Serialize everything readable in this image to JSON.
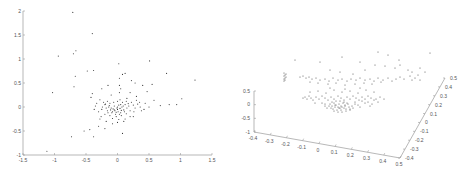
{
  "chart_data": [
    {
      "type": "scatter",
      "title": "",
      "xlabel": "",
      "ylabel": "",
      "xlim": [
        -1.5,
        1.5
      ],
      "ylim": [
        -1,
        2
      ],
      "grid": false,
      "legend": null,
      "x_ticks": [
        "-1.5",
        "-1",
        "-0.5",
        "0",
        "0.5",
        "1",
        "1.5"
      ],
      "y_ticks": [
        "2",
        "1.5",
        "1",
        "0.5",
        "0",
        "-0.5",
        "-1"
      ],
      "frame": {
        "left": 23,
        "right": 212,
        "top": 11,
        "bottom": 155
      },
      "points": [
        [
          -0.71,
          1.97
        ],
        [
          -0.4,
          1.53
        ],
        [
          -0.66,
          1.17
        ],
        [
          -0.7,
          1.11
        ],
        [
          -0.94,
          1.06
        ],
        [
          0.02,
          0.9
        ],
        [
          0.51,
          0.96
        ],
        [
          -0.48,
          0.75
        ],
        [
          -0.38,
          0.76
        ],
        [
          -0.67,
          0.64
        ],
        [
          -0.69,
          0.42
        ],
        [
          0.08,
          0.68
        ],
        [
          0.12,
          0.7
        ],
        [
          0.78,
          0.7
        ],
        [
          1.23,
          0.56
        ],
        [
          -1.03,
          0.3
        ],
        [
          -0.44,
          -0.47
        ],
        [
          -0.53,
          -0.5
        ],
        [
          -0.73,
          -0.62
        ],
        [
          -0.38,
          -0.62
        ],
        [
          0.08,
          -0.55
        ],
        [
          -1.12,
          -0.92
        ],
        [
          1.02,
          0.17
        ],
        [
          0.94,
          0.05
        ],
        [
          0.82,
          0.05
        ],
        [
          0.68,
          0.03
        ],
        [
          0.58,
          0.14
        ],
        [
          0.47,
          0.32
        ],
        [
          0.55,
          0.47
        ],
        [
          0.4,
          0.45
        ],
        [
          0.28,
          0.5
        ],
        [
          0.22,
          0.55
        ],
        [
          0.03,
          0.6
        ],
        [
          0.03,
          0.45
        ],
        [
          0.03,
          0.3
        ],
        [
          0.04,
          0.15
        ],
        [
          0.05,
          0.38
        ],
        [
          -0.15,
          0.45
        ],
        [
          -0.25,
          0.38
        ],
        [
          -0.4,
          0.28
        ],
        [
          -0.42,
          0.2
        ],
        [
          -0.3,
          -0.4
        ],
        [
          -0.2,
          -0.45
        ],
        [
          -0.08,
          -0.35
        ],
        [
          0.1,
          -0.3
        ],
        [
          0.25,
          -0.2
        ],
        [
          0.42,
          -0.05
        ],
        [
          0.5,
          0.0
        ],
        [
          0.35,
          0.1
        ],
        [
          0.3,
          0.22
        ],
        [
          0.2,
          0.3
        ],
        [
          0.15,
          0.18
        ],
        [
          -0.1,
          0.25
        ],
        [
          -0.28,
          0.15
        ],
        [
          -0.35,
          0.02
        ],
        [
          -0.3,
          -0.1
        ],
        [
          -0.25,
          -0.05
        ],
        [
          -0.2,
          0.05
        ],
        [
          -0.15,
          -0.12
        ],
        [
          -0.12,
          0.08
        ],
        [
          -0.1,
          -0.02
        ],
        [
          -0.08,
          -0.1
        ],
        [
          -0.05,
          0.02
        ],
        [
          -0.03,
          -0.15
        ],
        [
          0.0,
          -0.05
        ],
        [
          0.02,
          0.04
        ],
        [
          0.05,
          -0.12
        ],
        [
          0.07,
          0.0
        ],
        [
          0.1,
          -0.06
        ],
        [
          0.12,
          0.05
        ],
        [
          0.15,
          -0.02
        ],
        [
          0.18,
          0.02
        ],
        [
          0.2,
          -0.08
        ],
        [
          0.25,
          0.04
        ],
        [
          0.28,
          -0.02
        ],
        [
          0.32,
          0.06
        ],
        [
          -0.18,
          -0.02
        ],
        [
          -0.14,
          0.0
        ],
        [
          -0.11,
          -0.06
        ],
        [
          -0.07,
          -0.04
        ],
        [
          -0.04,
          -0.08
        ],
        [
          -0.01,
          -0.02
        ],
        [
          0.01,
          -0.1
        ],
        [
          0.04,
          -0.03
        ],
        [
          0.06,
          -0.07
        ],
        [
          0.09,
          0.02
        ],
        [
          -0.22,
          0.1
        ],
        [
          -0.16,
          0.12
        ],
        [
          -0.06,
          0.1
        ],
        [
          0.0,
          0.12
        ],
        [
          0.08,
          0.1
        ],
        [
          0.14,
          0.12
        ],
        [
          -0.2,
          -0.15
        ],
        [
          -0.12,
          -0.18
        ],
        [
          -0.02,
          -0.2
        ],
        [
          0.06,
          -0.18
        ],
        [
          0.14,
          -0.14
        ],
        [
          -0.26,
          -0.2
        ],
        [
          -0.08,
          -0.24
        ],
        [
          0.02,
          -0.26
        ],
        [
          -0.16,
          -0.08
        ],
        [
          -0.09,
          -0.12
        ],
        [
          -0.02,
          -0.11
        ],
        [
          0.03,
          -0.15
        ],
        [
          -0.13,
          0.03
        ],
        [
          -0.05,
          -0.06
        ],
        [
          0.0,
          0.0
        ],
        [
          0.05,
          0.05
        ],
        [
          -0.24,
          0.0
        ],
        [
          -0.19,
          0.06
        ],
        [
          0.11,
          -0.1
        ],
        [
          0.17,
          0.07
        ],
        [
          0.22,
          0.1
        ],
        [
          0.26,
          -0.1
        ],
        [
          0.3,
          0.14
        ],
        [
          0.36,
          0.0
        ],
        [
          0.38,
          -0.08
        ],
        [
          0.44,
          0.08
        ],
        [
          -0.33,
          0.08
        ],
        [
          -0.37,
          -0.05
        ],
        [
          -0.28,
          -0.25
        ],
        [
          -0.18,
          -0.3
        ],
        [
          0.0,
          -0.32
        ],
        [
          0.12,
          -0.25
        ],
        [
          0.2,
          -0.2
        ]
      ]
    },
    {
      "type": "scatter",
      "subtype": "scatter3d",
      "title": "",
      "xlabel": "",
      "ylabel": "",
      "zlabel": "",
      "xlim": [
        -0.4,
        0.5
      ],
      "ylim": [
        -0.4,
        0.5
      ],
      "zlim": [
        -1,
        0.5
      ],
      "grid": false,
      "legend": null,
      "x_ticks": [
        "-0.4",
        "-0.3",
        "-0.2",
        "-0.1",
        "0",
        "0.1",
        "0.2",
        "0.3",
        "0.4",
        "0.5"
      ],
      "y_ticks": [
        "-0.4",
        "-0.3",
        "-0.2",
        "-0.1",
        "0",
        "0.1",
        "0.2",
        "0.3",
        "0.4",
        "0.5"
      ],
      "z_ticks": [
        "0.5",
        "0",
        "-0.5",
        "-1"
      ],
      "axes_px": {
        "z_axis": {
          "x": 254,
          "top": 91,
          "bottom": 132
        },
        "x_axis": {
          "from": [
            254,
            132
          ],
          "to": [
            400,
            158
          ]
        },
        "y_axis": {
          "from": [
            400,
            158
          ],
          "to": [
            445,
            78
          ]
        }
      },
      "points_px": [
        [
          284,
          73
        ],
        [
          284,
          76
        ],
        [
          284,
          79
        ],
        [
          285,
          75
        ],
        [
          285,
          78
        ],
        [
          286,
          74
        ],
        [
          286,
          77
        ],
        [
          284,
          81
        ],
        [
          285,
          80
        ],
        [
          295,
          60
        ],
        [
          320,
          62
        ],
        [
          342,
          57
        ],
        [
          378,
          52
        ],
        [
          388,
          55
        ],
        [
          399,
          60
        ],
        [
          430,
          53
        ],
        [
          395,
          68
        ],
        [
          375,
          65
        ],
        [
          360,
          62
        ],
        [
          330,
          70
        ],
        [
          340,
          72
        ],
        [
          353,
          74
        ],
        [
          365,
          70
        ],
        [
          385,
          66
        ],
        [
          400,
          65
        ],
        [
          408,
          70
        ],
        [
          412,
          72
        ],
        [
          420,
          68
        ],
        [
          425,
          72
        ],
        [
          418,
          75
        ],
        [
          415,
          78
        ],
        [
          420,
          80
        ],
        [
          412,
          80
        ],
        [
          410,
          76
        ],
        [
          300,
          77
        ],
        [
          303,
          76
        ],
        [
          306,
          78
        ],
        [
          309,
          77
        ],
        [
          312,
          79
        ],
        [
          316,
          78
        ],
        [
          320,
          80
        ],
        [
          325,
          79
        ],
        [
          329,
          81
        ],
        [
          333,
          78
        ],
        [
          338,
          80
        ],
        [
          342,
          79
        ],
        [
          347,
          81
        ],
        [
          351,
          79
        ],
        [
          356,
          80
        ],
        [
          360,
          78
        ],
        [
          365,
          80
        ],
        [
          370,
          79
        ],
        [
          374,
          81
        ],
        [
          378,
          78
        ],
        [
          383,
          80
        ],
        [
          388,
          78
        ],
        [
          392,
          81
        ],
        [
          396,
          79
        ],
        [
          400,
          77
        ],
        [
          404,
          79
        ],
        [
          310,
          82
        ],
        [
          318,
          83
        ],
        [
          328,
          84
        ],
        [
          336,
          83
        ],
        [
          345,
          85
        ],
        [
          355,
          84
        ],
        [
          364,
          83
        ],
        [
          372,
          84
        ],
        [
          381,
          82
        ],
        [
          305,
          97
        ],
        [
          307,
          99
        ],
        [
          303,
          98
        ],
        [
          309,
          96
        ],
        [
          311,
          98
        ],
        [
          313,
          100
        ],
        [
          316,
          97
        ],
        [
          319,
          99
        ],
        [
          322,
          96
        ],
        [
          325,
          98
        ],
        [
          328,
          100
        ],
        [
          331,
          97
        ],
        [
          334,
          99
        ],
        [
          338,
          96
        ],
        [
          341,
          98
        ],
        [
          344,
          100
        ],
        [
          347,
          97
        ],
        [
          350,
          99
        ],
        [
          353,
          96
        ],
        [
          356,
          98
        ],
        [
          359,
          100
        ],
        [
          362,
          97
        ],
        [
          365,
          99
        ],
        [
          368,
          96
        ],
        [
          371,
          98
        ],
        [
          374,
          100
        ],
        [
          310,
          92
        ],
        [
          318,
          91
        ],
        [
          326,
          93
        ],
        [
          334,
          90
        ],
        [
          342,
          92
        ],
        [
          350,
          91
        ],
        [
          358,
          93
        ],
        [
          366,
          90
        ],
        [
          374,
          92
        ],
        [
          330,
          88
        ],
        [
          345,
          89
        ],
        [
          360,
          88
        ],
        [
          315,
          103
        ],
        [
          325,
          104
        ],
        [
          335,
          105
        ],
        [
          345,
          106
        ],
        [
          355,
          104
        ],
        [
          365,
          103
        ],
        [
          372,
          104
        ],
        [
          340,
          108
        ],
        [
          350,
          109
        ],
        [
          360,
          107
        ],
        [
          330,
          104
        ],
        [
          332,
          106
        ],
        [
          334,
          103
        ],
        [
          336,
          105
        ],
        [
          338,
          107
        ],
        [
          339,
          104
        ],
        [
          341,
          106
        ],
        [
          343,
          103
        ],
        [
          344,
          108
        ],
        [
          331,
          108
        ],
        [
          333,
          109
        ],
        [
          335,
          107
        ],
        [
          337,
          110
        ],
        [
          339,
          108
        ],
        [
          341,
          110
        ],
        [
          342,
          107
        ],
        [
          345,
          105
        ],
        [
          346,
          109
        ],
        [
          348,
          104
        ],
        [
          349,
          107
        ],
        [
          332,
          102
        ],
        [
          336,
          101
        ],
        [
          340,
          101
        ],
        [
          344,
          102
        ],
        [
          347,
          103
        ],
        [
          329,
          106
        ],
        [
          327,
          108
        ],
        [
          350,
          110
        ],
        [
          352,
          106
        ],
        [
          353,
          108
        ],
        [
          338,
          112
        ],
        [
          342,
          112
        ],
        [
          346,
          111
        ],
        [
          334,
          111
        ],
        [
          325,
          106
        ],
        [
          322,
          103
        ],
        [
          355,
          102
        ],
        [
          358,
          105
        ],
        [
          362,
          101
        ],
        [
          368,
          102
        ],
        [
          376,
          99
        ],
        [
          380,
          97
        ],
        [
          384,
          99
        ],
        [
          378,
          102
        ],
        [
          370,
          106
        ]
      ]
    }
  ]
}
